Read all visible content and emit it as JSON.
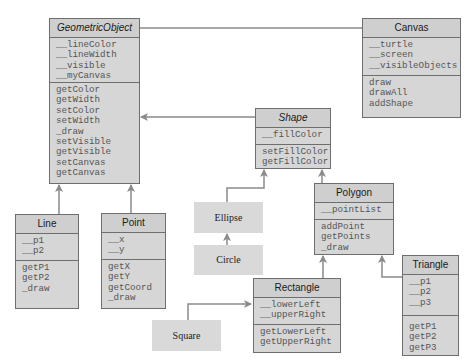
{
  "diagram": {
    "type": "UML class diagram",
    "classes": {
      "geometricObject": {
        "name": "GeometricObject",
        "abstract": true,
        "attributes": [
          "__lineColor",
          "__lineWidth",
          "__visible",
          "__myCanvas"
        ],
        "methods": [
          "getColor",
          "getWidth",
          "setColor",
          "setWidth",
          "_draw",
          "setVisible",
          "getVisible",
          "setCanvas",
          "getCanvas"
        ]
      },
      "canvas": {
        "name": "Canvas",
        "abstract": false,
        "attributes": [
          "__turtle",
          "__screen",
          "__visibleObjects"
        ],
        "methods": [
          "draw",
          "drawAll",
          "addShape"
        ]
      },
      "shape": {
        "name": "Shape",
        "abstract": true,
        "attributes": [
          "__fillColor"
        ],
        "methods": [
          "setFillColor",
          "getFillColor"
        ]
      },
      "polygon": {
        "name": "Polygon",
        "abstract": false,
        "attributes": [
          "__pointList"
        ],
        "methods": [
          "addPoint",
          "getPoints",
          "_draw"
        ]
      },
      "triangle": {
        "name": "Triangle",
        "abstract": false,
        "attributes": [
          "__p1",
          "__p2",
          "__p3"
        ],
        "methods": [
          "getP1",
          "getP2",
          "getP3"
        ]
      },
      "line": {
        "name": "Line",
        "abstract": false,
        "attributes": [
          "__p1",
          "__p2"
        ],
        "methods": [
          "getP1",
          "getP2",
          "_draw"
        ]
      },
      "point": {
        "name": "Point",
        "abstract": false,
        "attributes": [
          "__x",
          "__y"
        ],
        "methods": [
          "getX",
          "getY",
          "getCoord",
          "_draw"
        ]
      },
      "rectangle": {
        "name": "Rectangle",
        "abstract": false,
        "attributes": [
          "__lowerLeft",
          "__upperRight"
        ],
        "methods": [
          "getLowerLeft",
          "getUpperRight"
        ]
      }
    },
    "simple_classes": {
      "ellipse": "Ellipse",
      "circle": "Circle",
      "square": "Square"
    },
    "relationships": [
      {
        "from": "Canvas",
        "to": "GeometricObject",
        "kind": "association"
      },
      {
        "from": "Shape",
        "to": "GeometricObject",
        "kind": "inheritance"
      },
      {
        "from": "Line",
        "to": "GeometricObject",
        "kind": "inheritance"
      },
      {
        "from": "Point",
        "to": "GeometricObject",
        "kind": "inheritance"
      },
      {
        "from": "Ellipse",
        "to": "Shape",
        "kind": "inheritance"
      },
      {
        "from": "Polygon",
        "to": "Shape",
        "kind": "inheritance"
      },
      {
        "from": "Circle",
        "to": "Ellipse",
        "kind": "inheritance"
      },
      {
        "from": "Rectangle",
        "to": "Polygon",
        "kind": "inheritance"
      },
      {
        "from": "Triangle",
        "to": "Polygon",
        "kind": "inheritance"
      },
      {
        "from": "Square",
        "to": "Rectangle",
        "kind": "inheritance"
      }
    ],
    "colors": {
      "box_fill": "#d6d6d6",
      "border": "#6e6e6e",
      "connector": "#8a8a8a",
      "text": "#555555"
    }
  }
}
